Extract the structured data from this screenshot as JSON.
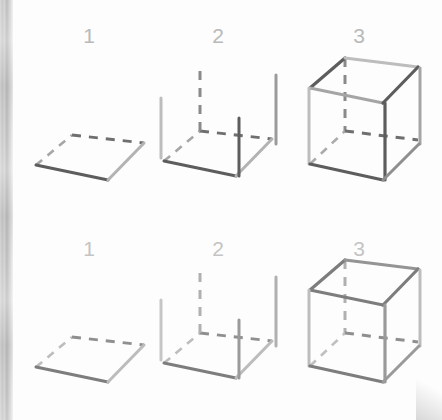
{
  "page": {
    "width": 442,
    "height": 420,
    "background_color": "#fdfdfd",
    "binding_color": "#c9c9c9"
  },
  "colors": {
    "edge_dark": "#595959",
    "edge_mid": "#7a7a7a",
    "edge_light": "#b5b5b5",
    "edge_faded": "#9a9a9a",
    "edge_faded_light": "#c2c2c2",
    "label": "#b9b9b9",
    "label_faded": "#c4c4c4"
  },
  "rows": [
    {
      "name": "row-top",
      "steps": [
        {
          "label": "1",
          "caption": "1",
          "description": "square base outline, two solid front edges and two dashed hidden back edges"
        },
        {
          "label": "2",
          "caption": "2",
          "description": "base plus four vertical edges rising from each corner, rear vertical dashed"
        },
        {
          "label": "3",
          "caption": "3",
          "description": "completed cube with top face closed, hidden rear edges dashed"
        }
      ]
    },
    {
      "name": "row-bottom",
      "steps": [
        {
          "label": "1",
          "caption": "1",
          "description": "square base outline, faded repeat of step 1"
        },
        {
          "label": "2",
          "caption": "2",
          "description": "base plus four vertical edges, faded repeat of step 2"
        },
        {
          "label": "3",
          "caption": "3",
          "description": "completed cube, faded repeat of step 3"
        }
      ]
    }
  ]
}
